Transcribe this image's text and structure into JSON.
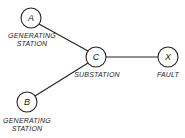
{
  "diagram": {
    "nodes": [
      {
        "id": "A",
        "letter": "A",
        "label_line1": "GENERATING",
        "label_line2": "STATION"
      },
      {
        "id": "B",
        "letter": "B",
        "label_line1": "GENERATING",
        "label_line2": "STATION"
      },
      {
        "id": "C",
        "letter": "C",
        "label_line1": "SUBSTATION"
      },
      {
        "id": "X",
        "letter": "X",
        "label_line1": "FAULT"
      }
    ],
    "edges": [
      {
        "from": "A",
        "to": "C"
      },
      {
        "from": "B",
        "to": "C"
      },
      {
        "from": "C",
        "to": "X"
      }
    ]
  }
}
